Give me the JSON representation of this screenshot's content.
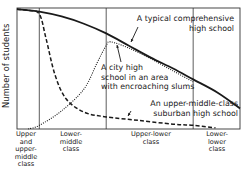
{
  "chart_data": {
    "type": "line",
    "title": "",
    "xlabel": "",
    "ylabel": "Number of students",
    "grid": false,
    "legend": "none (curves labeled by inline annotations with arrows)",
    "x_categories": [
      "Upper and upper-middle class",
      "Lower-middle class",
      "Upper-lower class",
      "Lower-lower class"
    ],
    "x_category_boundaries": [
      0,
      0.1,
      0.4,
      0.79,
      1.0
    ],
    "xlim": [
      0,
      1
    ],
    "ylim": [
      0,
      1
    ],
    "y_ticks": "none (qualitative axis)",
    "series": [
      {
        "name": "A typical comprehensive high school",
        "style": "solid-thick",
        "x": [
          0.0,
          0.1,
          0.2,
          0.3,
          0.4,
          0.5,
          0.6,
          0.7,
          0.79,
          0.9,
          1.0
        ],
        "y": [
          0.99,
          0.97,
          0.93,
          0.87,
          0.79,
          0.69,
          0.59,
          0.5,
          0.41,
          0.3,
          0.17
        ]
      },
      {
        "name": "A city high school in an area with encroaching slums",
        "style": "dotted",
        "x": [
          0.05,
          0.1,
          0.2,
          0.3,
          0.36,
          0.4,
          0.42,
          0.5,
          0.6,
          0.7,
          0.79
        ],
        "y": [
          0.0,
          0.03,
          0.15,
          0.33,
          0.55,
          0.69,
          0.72,
          0.67,
          0.58,
          0.48,
          0.39
        ]
      },
      {
        "name": "An upper-middle-class suburban high school",
        "style": "dashed",
        "x": [
          0.0,
          0.05,
          0.1,
          0.13,
          0.17,
          0.22,
          0.3,
          0.4,
          0.55,
          0.7,
          0.79,
          0.89
        ],
        "y": [
          0.99,
          0.98,
          0.95,
          0.75,
          0.45,
          0.25,
          0.14,
          0.1,
          0.07,
          0.04,
          0.03,
          0.01
        ]
      }
    ],
    "annotations": [
      {
        "text": "A typical comprehensive high school",
        "points_to": "solid curve near x≈0.62"
      },
      {
        "text": "A city high school in an area with encroaching slums",
        "points_to": "dotted curve near x≈0.46"
      },
      {
        "text": "An upper-middle-class suburban high school",
        "points_to": "dashed curve near x≈0.55"
      }
    ]
  },
  "labels": {
    "ylabel": "Number of students",
    "x_categories": [
      "Upper\nand\nupper-\nmiddle\nclass",
      "Lower-\nmiddle\nclass",
      "Upper-lower\nclass",
      "Lower-\nlower\nclass"
    ],
    "annotations": [
      "A typical comprehensive\nhigh school",
      "A city high\nschool in an area\nwith encroaching slums",
      "An upper-middle-class\nsuburban high school"
    ]
  },
  "colors": {
    "ink": "#1a1a1a",
    "frame": "#333333",
    "background": "#ffffff"
  }
}
